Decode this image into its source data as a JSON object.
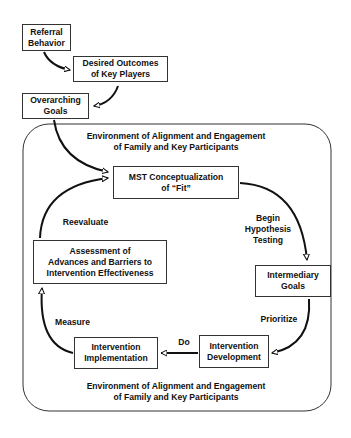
{
  "diagram": {
    "nodes": {
      "referral": {
        "line1": "Referral",
        "line2": "Behavior"
      },
      "desired": {
        "line1": "Desired Outcomes",
        "line2": "of Key Players"
      },
      "overarching": {
        "line1": "Overarching",
        "line2": "Goals"
      },
      "mst": {
        "line1": "MST Conceptualization",
        "line2": "of “Fit”"
      },
      "intermediary": {
        "line1": "Intermediary",
        "line2": "Goals"
      },
      "development": {
        "line1": "Intervention",
        "line2": "Development"
      },
      "implementation": {
        "line1": "Intervention",
        "line2": "Implementation"
      },
      "assessment": {
        "line1": "Assessment of",
        "line2": "Advances and Barriers to",
        "line3": "Intervention Effectiveness"
      }
    },
    "edge_labels": {
      "hypothesis": {
        "line1": "Begin",
        "line2": "Hypothesis",
        "line3": "Testing"
      },
      "prioritize": "Prioritize",
      "do": "Do",
      "measure": "Measure",
      "reevaluate": "Reevaluate"
    },
    "environment_top": {
      "line1": "Environment of Alignment and Engagement",
      "line2": "of Family and Key Participants"
    },
    "environment_bottom": {
      "line1": "Environment of Alignment and Engagement",
      "line2": "of Family and Key Participants"
    }
  }
}
